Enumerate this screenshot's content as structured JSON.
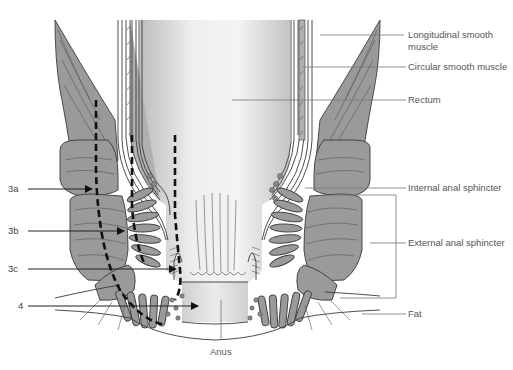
{
  "figure": {
    "type": "anatomical-cross-section"
  },
  "labels_right": [
    {
      "id": "longitudinal",
      "text": "Longitudinal smooth",
      "text2": "muscle"
    },
    {
      "id": "circular",
      "text": "Circular smooth muscle"
    },
    {
      "id": "rectum",
      "text": "Rectum"
    },
    {
      "id": "internal",
      "text": "Internal anal sphincter"
    },
    {
      "id": "external",
      "text": "External anal sphincter"
    },
    {
      "id": "fat",
      "text": "Fat"
    }
  ],
  "labels_left": [
    {
      "id": "3a",
      "text": "3a"
    },
    {
      "id": "3b",
      "text": "3b"
    },
    {
      "id": "3c",
      "text": "3c"
    },
    {
      "id": "4",
      "text": "4"
    }
  ],
  "label_bottom": {
    "id": "anus",
    "text": "Anus"
  },
  "colors": {
    "muscle_fill": "#9a9a9a",
    "outline": "#3a3a3a",
    "lumen_light": "#f2f2f2",
    "lumen_dark": "#c8c8c8",
    "background": "#ffffff",
    "label_text": "#555555",
    "dashed_path": "#111111"
  }
}
